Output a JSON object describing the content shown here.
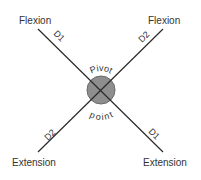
{
  "diagram": {
    "title": "",
    "pivot": {
      "label_top": "Pivot",
      "label_bottom": "point",
      "fill": "#8e8e8e",
      "stroke": "#6a6a6a"
    },
    "endpoints": {
      "top_left": "Flexion",
      "top_right": "Flexion",
      "bottom_left": "Extension",
      "bottom_right": "Extension"
    },
    "diagonals": {
      "d1_upper": "D1",
      "d2_upper": "D2",
      "d2_lower": "D2",
      "d1_lower": "D1"
    },
    "line_color": "#2a2a2a"
  }
}
